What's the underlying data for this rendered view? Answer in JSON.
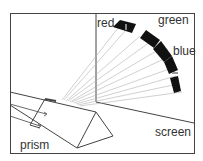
{
  "diagram": {
    "labels": {
      "red": "red",
      "green": "green",
      "blue": "blue",
      "screen": "screen",
      "prism": "prism"
    },
    "colors": {
      "line": "#333333",
      "ray": "#aaaaaa",
      "spectrum": "#111111",
      "background": "#ffffff"
    }
  }
}
